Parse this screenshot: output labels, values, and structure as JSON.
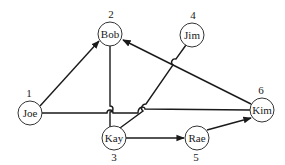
{
  "diagram": {
    "type": "directed-graph",
    "colors": {
      "line": "#1a1a1a",
      "node_fill": "#ffffff",
      "node_stroke": "#333333",
      "background": "#ffffff"
    },
    "nodes": [
      {
        "id": "joe",
        "name": "Joe",
        "number": "1"
      },
      {
        "id": "bob",
        "name": "Bob",
        "number": "2"
      },
      {
        "id": "kay",
        "name": "Kay",
        "number": "3"
      },
      {
        "id": "jim",
        "name": "Jim",
        "number": "4"
      },
      {
        "id": "rae",
        "name": "Rae",
        "number": "5"
      },
      {
        "id": "kim",
        "name": "Kim",
        "number": "6"
      }
    ],
    "edges": [
      {
        "from": "Joe",
        "to": "Bob",
        "directed": true
      },
      {
        "from": "Kim",
        "to": "Bob",
        "directed": true
      },
      {
        "from": "Joe",
        "to": "Kim",
        "directed": false
      },
      {
        "from": "Bob",
        "to": "Kay",
        "directed": false
      },
      {
        "from": "Jim",
        "to": "Kay",
        "directed": false
      },
      {
        "from": "Kay",
        "to": "Rae",
        "directed": true
      },
      {
        "from": "Rae",
        "to": "Kim",
        "directed": true
      }
    ]
  }
}
